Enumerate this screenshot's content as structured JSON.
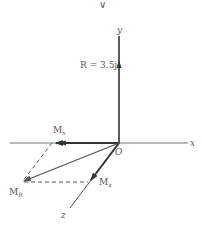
{
  "diagram": {
    "top_mark": "∨",
    "axes": {
      "x_label": "x",
      "y_label": "y",
      "z_label": "z",
      "origin_label": "O"
    },
    "vectors": {
      "resultant_force": {
        "label": "R = 3.5j",
        "color": "#333333"
      },
      "moment_x": {
        "label_main": "M",
        "label_sub": "x",
        "color": "#333333"
      },
      "moment_z": {
        "label_main": "M",
        "label_sub": "z",
        "color": "#333333"
      },
      "moment_resultant": {
        "label_main": "M",
        "label_sub": "R",
        "color": "#555555"
      }
    },
    "colors": {
      "axis": "#777777",
      "thick_vector": "#333333",
      "dashed": "#555555",
      "text": "#555555"
    }
  }
}
